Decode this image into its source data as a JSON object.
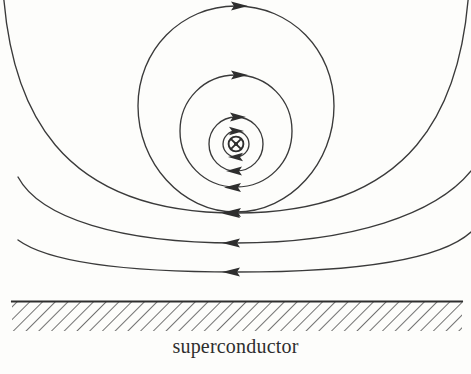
{
  "figure": {
    "kind": "physics-diagram",
    "width": 471,
    "height": 374,
    "background_color": "#fdfdfb",
    "stroke_color": "#3a3a3a"
  },
  "caption": {
    "label": "superconductor",
    "x": 236,
    "y": 358
  },
  "vortex_core": {
    "symbol": "⊗",
    "meaning": "field into page",
    "center_x": 236,
    "center_y": 144,
    "outer_radius": 7.5,
    "inner_dot_radius": 3.2,
    "stroke_color": "#2e2e2e"
  },
  "substrate": {
    "name": "superconductor-slab",
    "surface_line_y": 301,
    "hatch_bottom_y": 331,
    "left_x": 12,
    "right_x": 462,
    "hatch_angle_deg": 45,
    "hatch_spacing": 9,
    "hatch_color": "#5a5a5a",
    "surface_color": "#2e2e2e"
  },
  "closed_loops": [
    {
      "name": "loop-1",
      "radius": 13,
      "cy": 144,
      "top_arrow_y": 131,
      "bottom_arrow_y": 157
    },
    {
      "name": "loop-2",
      "radius": 27,
      "cy": 144,
      "top_arrow_y": 117,
      "bottom_arrow_y": 171
    },
    {
      "name": "loop-3",
      "radius": 56,
      "cy": 131,
      "top_arrow_y": 75,
      "bottom_arrow_y": 187
    },
    {
      "name": "loop-4",
      "radius": 98,
      "cy": 104,
      "top_arrow_y": 6,
      "bottom_arrow_y": 212
    }
  ],
  "open_arcs": [
    {
      "name": "arc-outer-1",
      "left_end_x": 8,
      "left_end_y": -34,
      "right_end_x": 464,
      "right_end_y": -34,
      "apex_y": 242
    },
    {
      "name": "arc-outer-2",
      "left_end_x": 18,
      "left_end_y": 177,
      "right_end_x": 471,
      "right_end_y": 172,
      "apex_y": 242
    },
    {
      "name": "arc-outer-3",
      "left_end_x": 18,
      "left_end_y": 240,
      "right_end_x": 471,
      "right_end_y": 233,
      "apex_y": 271
    }
  ],
  "arrow_directions": {
    "top_of_loop": "right",
    "bottom_of_loop": "left",
    "circulation": "clockwise"
  },
  "colors": {
    "stroke": "#3a3a3a",
    "hatch": "#5a5a5a",
    "text": "#2e2e2e",
    "background": "#fdfdfb"
  }
}
